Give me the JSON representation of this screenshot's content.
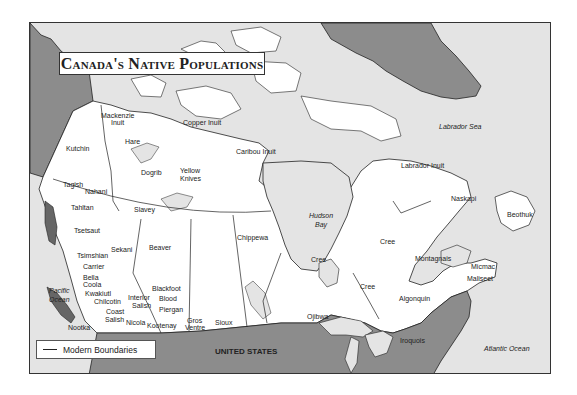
{
  "title": "Canada's Native Populations",
  "legend": {
    "items": [
      {
        "symbol": "line",
        "label": "Modern Boundaries"
      }
    ]
  },
  "colors": {
    "water": "#e4e4e4",
    "canada_land": "#ffffff",
    "foreign_land": "#8c8c8c",
    "border": "#333333"
  },
  "water_labels": [
    {
      "id": "labrador-sea",
      "text": "Labrador Sea",
      "x": 438,
      "y": 126
    },
    {
      "id": "hudson-bay-1",
      "text": "Hudson",
      "x": 308,
      "y": 215
    },
    {
      "id": "hudson-bay-2",
      "text": "Bay",
      "x": 314,
      "y": 224
    },
    {
      "id": "pacific-ocean-1",
      "text": "Pacific",
      "x": 48,
      "y": 290
    },
    {
      "id": "pacific-ocean-2",
      "text": "Ocean",
      "x": 48,
      "y": 299
    },
    {
      "id": "atlantic-ocean",
      "text": "Atlantic Ocean",
      "x": 483,
      "y": 348
    }
  ],
  "country_labels": [
    {
      "id": "united-states",
      "text": "UNITED STATES",
      "x": 214,
      "y": 351
    }
  ],
  "peoples": [
    {
      "text": "Mackenzie",
      "x": 100,
      "y": 115
    },
    {
      "text": "Inuit",
      "x": 110,
      "y": 122
    },
    {
      "text": "Copper Inuit",
      "x": 182,
      "y": 122
    },
    {
      "text": "Kutchin",
      "x": 65,
      "y": 148
    },
    {
      "text": "Hare",
      "x": 124,
      "y": 141
    },
    {
      "text": "Caribou Inuit",
      "x": 235,
      "y": 151
    },
    {
      "text": "Dogrib",
      "x": 140,
      "y": 172
    },
    {
      "text": "Yellow",
      "x": 179,
      "y": 170
    },
    {
      "text": "Knives",
      "x": 179,
      "y": 178
    },
    {
      "text": "Tagish",
      "x": 62,
      "y": 184
    },
    {
      "text": "Nahani",
      "x": 84,
      "y": 191
    },
    {
      "text": "Tahltan",
      "x": 70,
      "y": 207
    },
    {
      "text": "Slavey",
      "x": 133,
      "y": 209
    },
    {
      "text": "Tsetsaut",
      "x": 73,
      "y": 230
    },
    {
      "text": "Chippewa",
      "x": 236,
      "y": 237
    },
    {
      "text": "Sekani",
      "x": 110,
      "y": 249
    },
    {
      "text": "Beaver",
      "x": 148,
      "y": 247
    },
    {
      "text": "Tsimshian",
      "x": 76,
      "y": 255
    },
    {
      "text": "Carrier",
      "x": 82,
      "y": 266
    },
    {
      "text": "Bella",
      "x": 82,
      "y": 277
    },
    {
      "text": "Coola",
      "x": 82,
      "y": 284
    },
    {
      "text": "Kwakiutl",
      "x": 84,
      "y": 293
    },
    {
      "text": "Blackfoot",
      "x": 151,
      "y": 288
    },
    {
      "text": "Chilcotin",
      "x": 93,
      "y": 301
    },
    {
      "text": "Interior",
      "x": 127,
      "y": 297
    },
    {
      "text": "Salish",
      "x": 131,
      "y": 305
    },
    {
      "text": "Blood",
      "x": 158,
      "y": 298
    },
    {
      "text": "Piergan",
      "x": 158,
      "y": 309
    },
    {
      "text": "Coast",
      "x": 105,
      "y": 311
    },
    {
      "text": "Salish",
      "x": 104,
      "y": 319
    },
    {
      "text": "Nicola",
      "x": 125,
      "y": 322
    },
    {
      "text": "Kootenay",
      "x": 146,
      "y": 325
    },
    {
      "text": "Gros",
      "x": 186,
      "y": 320
    },
    {
      "text": "Ventre",
      "x": 184,
      "y": 327
    },
    {
      "text": "Sioux",
      "x": 214,
      "y": 322
    },
    {
      "text": "Nootka",
      "x": 67,
      "y": 327
    },
    {
      "text": "Labrador Inuit",
      "x": 400,
      "y": 165
    },
    {
      "text": "Naskapi",
      "x": 450,
      "y": 198
    },
    {
      "text": "Beothuk",
      "x": 506,
      "y": 214
    },
    {
      "text": "Cree",
      "x": 379,
      "y": 241
    },
    {
      "text": "Cree",
      "x": 310,
      "y": 259
    },
    {
      "text": "Montagnais",
      "x": 414,
      "y": 258
    },
    {
      "text": "Cree",
      "x": 359,
      "y": 286
    },
    {
      "text": "Algonquin",
      "x": 398,
      "y": 298
    },
    {
      "text": "Ojibwa",
      "x": 306,
      "y": 316
    },
    {
      "text": "Micmac",
      "x": 470,
      "y": 266
    },
    {
      "text": "Maliseet",
      "x": 466,
      "y": 278
    },
    {
      "text": "Iroquois",
      "x": 399,
      "y": 340
    }
  ]
}
